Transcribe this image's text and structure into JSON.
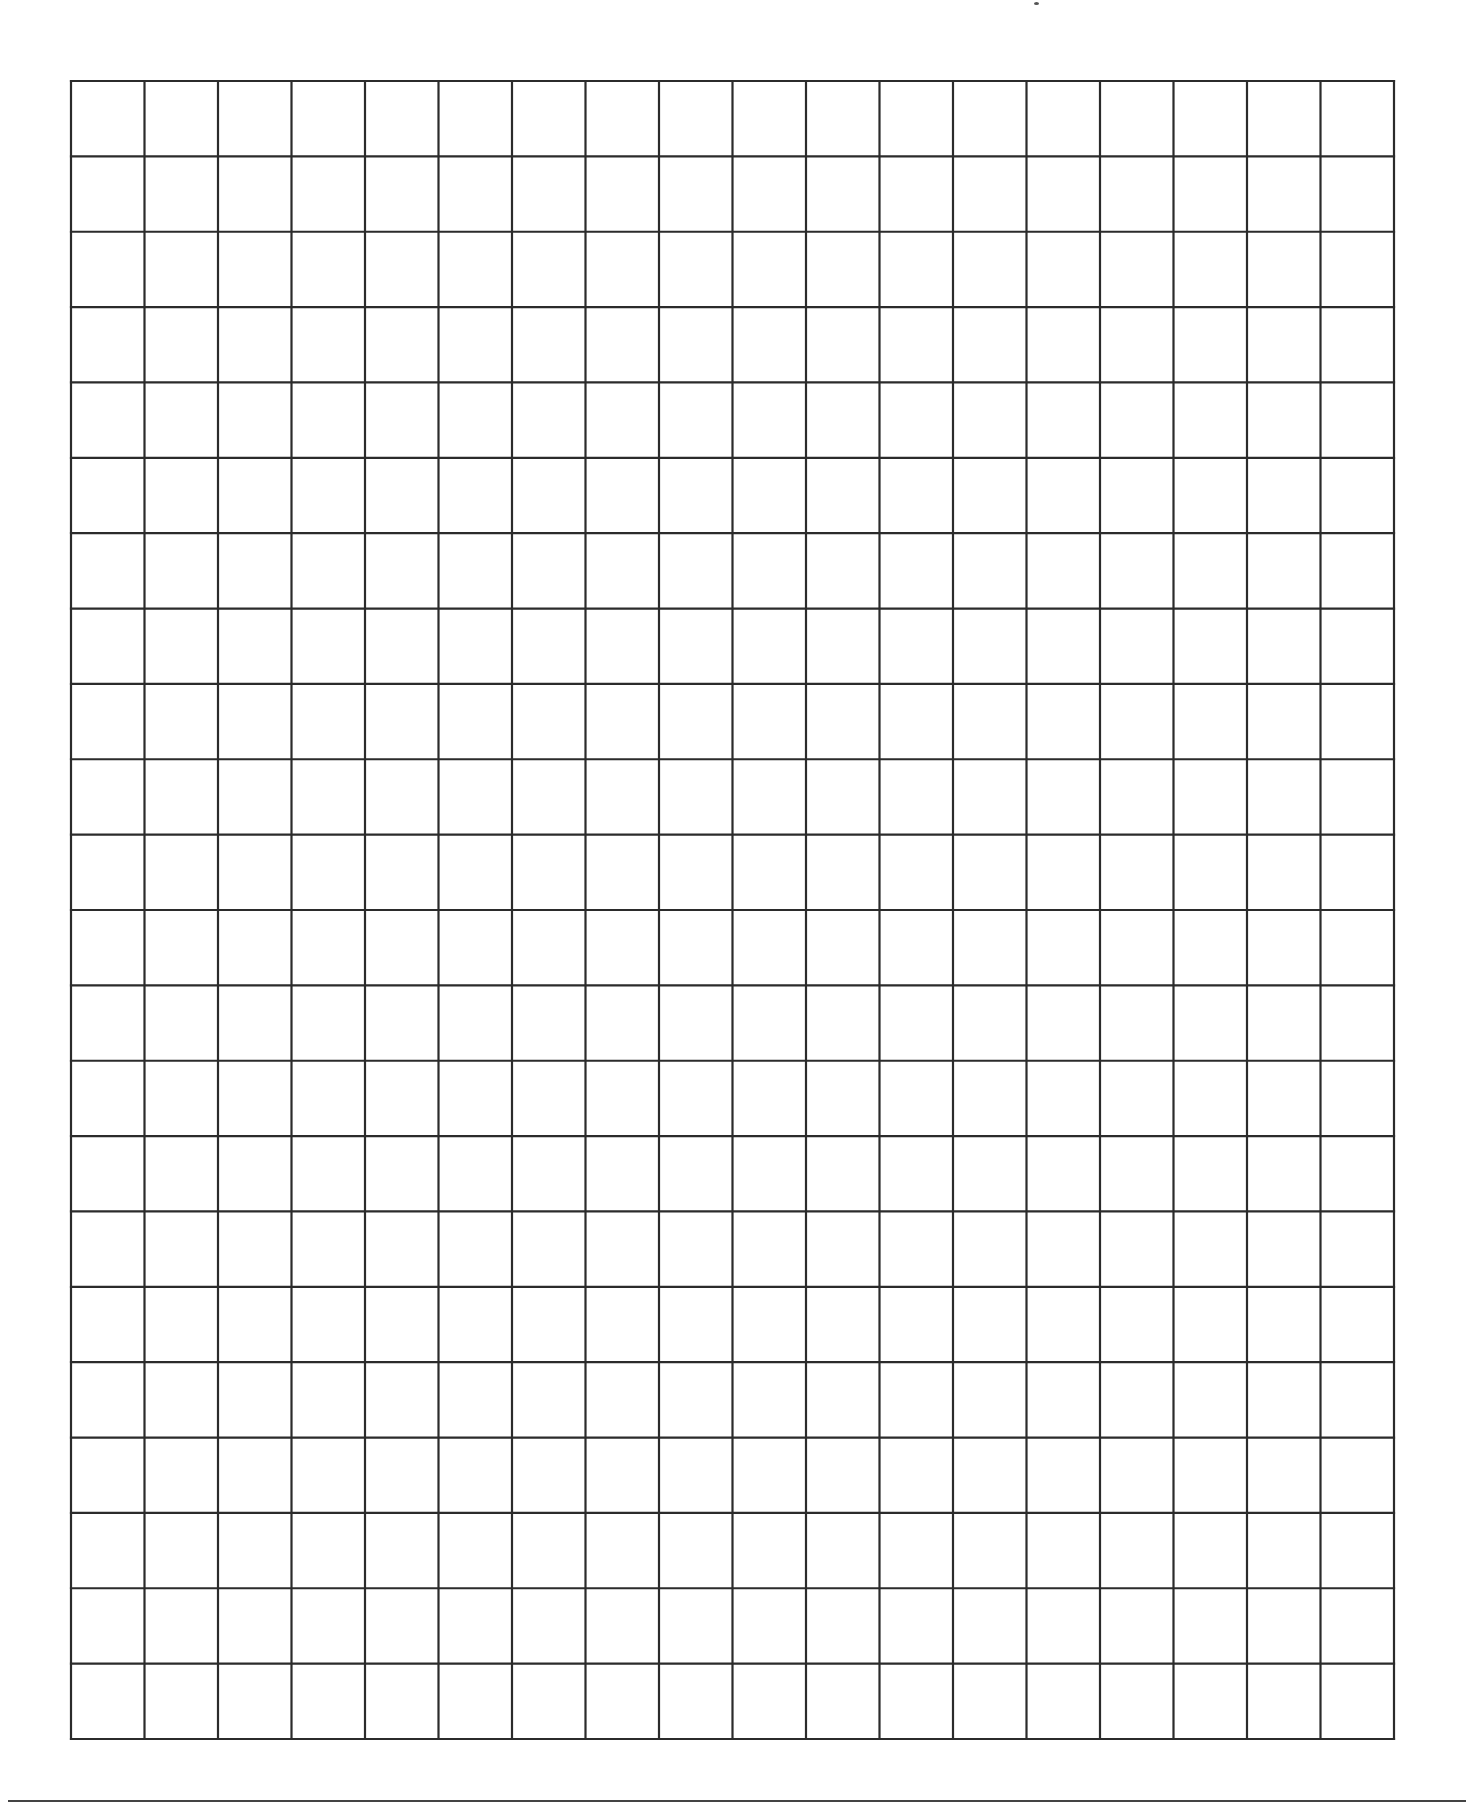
{
  "page": {
    "width": 1466,
    "height": 1811,
    "background": "#ffffff"
  },
  "grid": {
    "columns": 18,
    "rows": 22,
    "left": 71,
    "top": 81,
    "right": 1394,
    "bottom": 1739,
    "line_color": "#2b2b2b",
    "line_width": 2.2
  },
  "footer_rule": {
    "y": 1800,
    "x_start": 8,
    "x_end": 1466,
    "color": "#444444"
  },
  "stray_mark": {
    "x": 1034,
    "y": 2
  }
}
